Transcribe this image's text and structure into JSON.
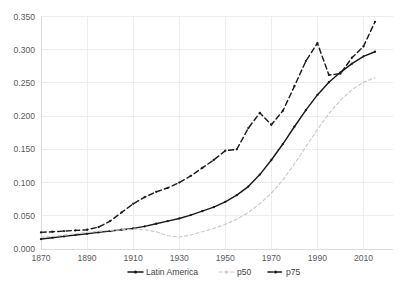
{
  "chart_data": {
    "type": "line",
    "title": "",
    "subtitle": "",
    "xlabel": "",
    "ylabel": "",
    "xlim": [
      1870,
      2015
    ],
    "ylim": [
      0.0,
      0.35
    ],
    "grid": true,
    "legend_position": "bottom",
    "y_ticks": [
      "0.000",
      "0.050",
      "0.100",
      "0.150",
      "0.200",
      "0.250",
      "0.300",
      "0.350"
    ],
    "y_tick_values": [
      0.0,
      0.05,
      0.1,
      0.15,
      0.2,
      0.25,
      0.3,
      0.35
    ],
    "x_ticks": [
      "1870",
      "1890",
      "1910",
      "1930",
      "1950",
      "1970",
      "1990",
      "2010"
    ],
    "x_tick_values": [
      1870,
      1890,
      1910,
      1930,
      1950,
      1970,
      1990,
      2010
    ],
    "series": [
      {
        "name": "Latin America",
        "color": "#191919",
        "style": "solid-with-markers",
        "x": [
          1870,
          1875,
          1880,
          1885,
          1890,
          1895,
          1900,
          1905,
          1910,
          1915,
          1920,
          1925,
          1930,
          1935,
          1940,
          1945,
          1950,
          1955,
          1960,
          1965,
          1970,
          1975,
          1980,
          1985,
          1990,
          1995,
          2000,
          2005,
          2010,
          2015
        ],
        "values": [
          0.015,
          0.017,
          0.019,
          0.021,
          0.023,
          0.025,
          0.027,
          0.029,
          0.031,
          0.034,
          0.038,
          0.042,
          0.046,
          0.051,
          0.057,
          0.063,
          0.071,
          0.081,
          0.094,
          0.112,
          0.134,
          0.158,
          0.184,
          0.209,
          0.232,
          0.251,
          0.266,
          0.279,
          0.29,
          0.297
        ]
      },
      {
        "name": "p50",
        "color": "#c9c9cd",
        "style": "dashed",
        "x": [
          1870,
          1875,
          1880,
          1885,
          1890,
          1895,
          1900,
          1905,
          1910,
          1915,
          1920,
          1925,
          1930,
          1935,
          1940,
          1945,
          1950,
          1955,
          1960,
          1965,
          1970,
          1975,
          1980,
          1985,
          1990,
          1995,
          2000,
          2005,
          2010,
          2015
        ],
        "values": [
          0.018,
          0.019,
          0.021,
          0.023,
          0.025,
          0.027,
          0.028,
          0.029,
          0.03,
          0.029,
          0.026,
          0.02,
          0.018,
          0.021,
          0.026,
          0.031,
          0.037,
          0.045,
          0.055,
          0.068,
          0.084,
          0.104,
          0.128,
          0.154,
          0.18,
          0.204,
          0.224,
          0.24,
          0.251,
          0.258
        ]
      },
      {
        "name": "p75",
        "color": "#1c1c1c",
        "style": "dashed-with-markers",
        "x": [
          1870,
          1875,
          1880,
          1885,
          1890,
          1895,
          1900,
          1905,
          1910,
          1915,
          1920,
          1925,
          1930,
          1935,
          1940,
          1945,
          1950,
          1955,
          1960,
          1965,
          1970,
          1975,
          1980,
          1985,
          1990,
          1995,
          2000,
          2005,
          2010,
          2015
        ],
        "values": [
          0.025,
          0.026,
          0.027,
          0.028,
          0.029,
          0.033,
          0.042,
          0.055,
          0.068,
          0.078,
          0.086,
          0.092,
          0.1,
          0.11,
          0.122,
          0.134,
          0.148,
          0.15,
          0.182,
          0.205,
          0.187,
          0.208,
          0.245,
          0.283,
          0.31,
          0.262,
          0.264,
          0.288,
          0.305,
          0.342
        ]
      }
    ],
    "annotations": []
  },
  "legend": {
    "items": [
      {
        "label": "Latin America",
        "marker": "line-solid-marker"
      },
      {
        "label": "p50",
        "marker": "line-dashed-light"
      },
      {
        "label": "p75",
        "marker": "line-dashed-dark"
      }
    ]
  }
}
